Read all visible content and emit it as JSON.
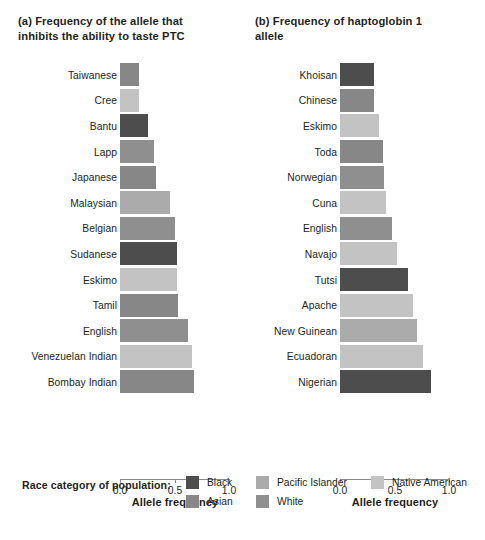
{
  "colors": {
    "black": "#4d4d4d",
    "asian": "#878787",
    "pacific_islander": "#ababab",
    "white": "#8f8f8f",
    "native_american": "#c3c3c3",
    "axis": "#8a8a8a",
    "text": "#231f20"
  },
  "panel_a": {
    "title": "(a) Frequency of the allele that\n      inhibits the ability to taste PTC",
    "axis_title": "Allele frequency",
    "ticks": [
      "0.0",
      "0.5",
      "1.0"
    ]
  },
  "panel_b": {
    "title": "(b) Frequency of haptoglobin 1\n      allele",
    "axis_title": "Allele frequency",
    "ticks": [
      "0.0",
      "0.5",
      "1.0"
    ]
  },
  "legend": {
    "title": "Race category of population:",
    "items": [
      {
        "label": "Black",
        "color": "#4d4d4d"
      },
      {
        "label": "Asian",
        "color": "#878787"
      },
      {
        "label": "Pacific Islander",
        "color": "#ababab"
      },
      {
        "label": "White",
        "color": "#8f8f8f"
      },
      {
        "label": "Native American",
        "color": "#c3c3c3"
      }
    ]
  },
  "chart_data": [
    {
      "type": "bar",
      "orientation": "horizontal",
      "panel": "(a)",
      "title": "(a) Frequency of the allele that inhibits the ability to taste PTC",
      "xlabel": "Allele frequency",
      "ylabel": "",
      "xlim": [
        0.0,
        1.0
      ],
      "xticks": [
        0.0,
        0.5,
        1.0
      ],
      "grid": false,
      "legend_position": "bottom",
      "categories": [
        "Taiwanese",
        "Cree",
        "Bantu",
        "Lapp",
        "Japanese",
        "Malaysian",
        "Belgian",
        "Sudanese",
        "Eskimo",
        "Tamil",
        "English",
        "Venezuelan Indian",
        "Bombay Indian"
      ],
      "values": [
        0.17,
        0.17,
        0.25,
        0.31,
        0.33,
        0.45,
        0.5,
        0.52,
        0.52,
        0.53,
        0.62,
        0.65,
        0.67
      ],
      "race_categories": [
        "Asian",
        "Native American",
        "Black",
        "White",
        "Asian",
        "Pacific Islander",
        "White",
        "Black",
        "Native American",
        "Asian",
        "White",
        "Native American",
        "Asian"
      ],
      "bar_colors": [
        "#878787",
        "#c3c3c3",
        "#4d4d4d",
        "#8f8f8f",
        "#878787",
        "#ababab",
        "#8f8f8f",
        "#4d4d4d",
        "#c3c3c3",
        "#878787",
        "#8f8f8f",
        "#c3c3c3",
        "#878787"
      ]
    },
    {
      "type": "bar",
      "orientation": "horizontal",
      "panel": "(b)",
      "title": "(b) Frequency of haptoglobin 1 allele",
      "xlabel": "Allele frequency",
      "ylabel": "",
      "xlim": [
        0.0,
        1.0
      ],
      "xticks": [
        0.0,
        0.5,
        1.0
      ],
      "grid": false,
      "legend_position": "bottom",
      "categories": [
        "Khoisan",
        "Chinese",
        "Eskimo",
        "Toda",
        "Norwegian",
        "Cuna",
        "English",
        "Navajo",
        "Tutsi",
        "Apache",
        "New Guinean",
        "Ecuadoran",
        "Nigerian"
      ],
      "values": [
        0.31,
        0.31,
        0.35,
        0.39,
        0.4,
        0.42,
        0.47,
        0.52,
        0.62,
        0.66,
        0.7,
        0.75,
        0.83
      ],
      "race_categories": [
        "Black",
        "Asian",
        "Native American",
        "Asian",
        "White",
        "Native American",
        "White",
        "Native American",
        "Black",
        "Native American",
        "Pacific Islander",
        "Native American",
        "Black"
      ],
      "bar_colors": [
        "#4d4d4d",
        "#878787",
        "#c3c3c3",
        "#878787",
        "#8f8f8f",
        "#c3c3c3",
        "#8f8f8f",
        "#c3c3c3",
        "#4d4d4d",
        "#c3c3c3",
        "#ababab",
        "#c3c3c3",
        "#4d4d4d"
      ]
    }
  ]
}
